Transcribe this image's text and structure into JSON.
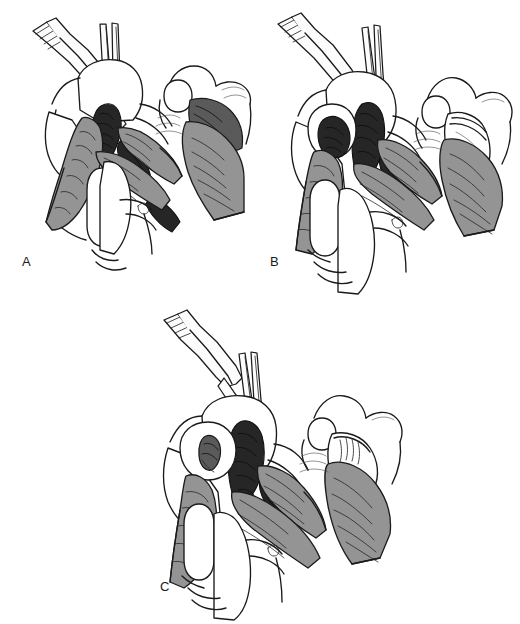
{
  "figure": {
    "type": "medical-surgical-illustration",
    "style": "black-and-white line art with gray tone shading",
    "background_color": "#ffffff",
    "width": 520,
    "height": 624,
    "caption": "",
    "panel_count": 3
  },
  "palette": {
    "outline": "#1a1a1a",
    "background": "#ffffff",
    "tissue_midtone": "#949494",
    "tissue_dark": "#5a5a5a",
    "tissue_near_black": "#262626",
    "instrument_metal": "#fcfcfc",
    "label_color": "#1a1a1a"
  },
  "panels": [
    {
      "id": "a",
      "label": "A",
      "label_position": {
        "x": 22,
        "y": 255
      },
      "description": "Operative view of digit with two surgical instruments retracting tissue; dark exposed tissue between flaps",
      "views": [
        {
          "name": "main-operative-view",
          "instruments": [
            "toothed-forceps",
            "fine-forceps"
          ],
          "shading": [
            "tissue_near_black",
            "tissue_midtone"
          ]
        },
        {
          "name": "lateral-inset-view",
          "shading": [
            "tissue_dark",
            "tissue_midtone"
          ],
          "state": "dark tissue fully exposed"
        }
      ]
    },
    {
      "id": "b",
      "label": "B",
      "label_position": {
        "x": 270,
        "y": 255
      },
      "description": "Same operative field with instruments repositioned; tissue flap advanced partially over defect",
      "views": [
        {
          "name": "main-operative-view",
          "instruments": [
            "toothed-forceps",
            "fine-forceps"
          ],
          "shading": [
            "tissue_near_black",
            "tissue_midtone"
          ]
        },
        {
          "name": "lateral-inset-view",
          "shading": [
            "tissue_midtone"
          ],
          "state": "flap partially covering"
        }
      ]
    },
    {
      "id": "c",
      "label": "C",
      "label_position": {
        "x": 160,
        "y": 580
      },
      "description": "Final stage with tissue flap advanced to cover the defect; instruments holding closure",
      "views": [
        {
          "name": "main-operative-view",
          "instruments": [
            "toothed-forceps",
            "fine-forceps"
          ],
          "shading": [
            "tissue_near_black",
            "tissue_midtone"
          ]
        },
        {
          "name": "lateral-inset-view",
          "shading": [
            "tissue_midtone"
          ],
          "state": "flap fully covering, closed"
        }
      ]
    }
  ]
}
